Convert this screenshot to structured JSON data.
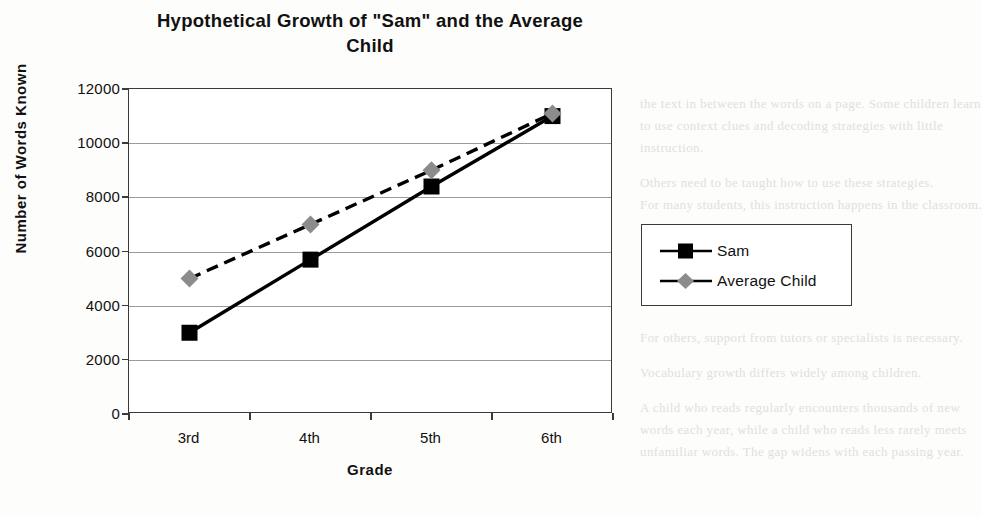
{
  "chart_data": {
    "type": "line",
    "title": "Hypothetical Growth of \"Sam\" and the Average Child",
    "title_line1": "Hypothetical Growth of \"Sam\" and the Average",
    "title_line2": "Child",
    "xlabel": "Grade",
    "ylabel": "Number of Words Known",
    "categories": [
      "3rd",
      "4th",
      "5th",
      "6th"
    ],
    "ylim": [
      0,
      12000
    ],
    "ytick_values": [
      0,
      2000,
      4000,
      6000,
      8000,
      10000,
      12000
    ],
    "ytick_labels": [
      "0",
      "2000",
      "4000",
      "6000",
      "8000",
      "10000",
      "12000"
    ],
    "grid": "horizontal",
    "legend_position": "right",
    "series": [
      {
        "name": "Sam",
        "values": [
          3000,
          5700,
          8400,
          11000
        ],
        "line_style": "solid",
        "line_color": "#000000",
        "marker": "square",
        "marker_color": "#000000"
      },
      {
        "name": "Average Child",
        "values": [
          5000,
          7000,
          9000,
          11100
        ],
        "line_style": "dashed",
        "line_color": "#000000",
        "marker": "diamond",
        "marker_color": "#8c8c8c"
      }
    ]
  },
  "colors": {
    "sam": "#000000",
    "average_child": "#8c8c8c",
    "axis": "#3a3a3a",
    "grid": "#9a9a9a",
    "page_background": "#fdfdfb"
  },
  "background_text": {
    "right_lines": [
      "the text in between the words on a page. Some children learn",
      "to use context clues and decoding strategies with little",
      "instruction.",
      "Others need to be taught how to use these strategies.",
      "For many students, this instruction happens in the classroom.",
      "For others, support from tutors or specialists is necessary.",
      "Vocabulary growth differs widely among children.",
      "A child who reads regularly encounters thousands of new",
      "words each year, while a child who reads less rarely meets",
      "unfamiliar words. The gap widens with each passing year."
    ],
    "left_lines": [
      "learn",
      "for",
      "each"
    ]
  }
}
